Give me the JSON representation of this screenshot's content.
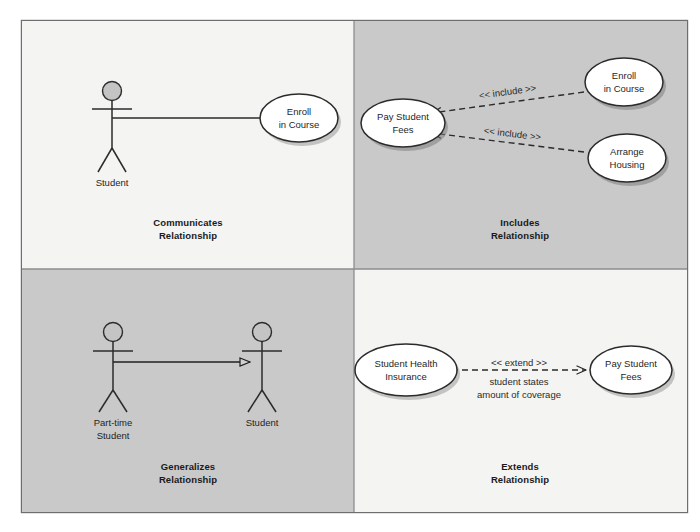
{
  "figure": {
    "background_color": "#ffffff",
    "frame_border_color": "#6e6e6e",
    "panel_light_color": "#f4f4f2",
    "panel_shaded_color": "#c9c9c9",
    "stroke_color": "#2b2b2b",
    "ellipse_fill": "#ffffff",
    "ellipse_stroke": "#2b2b2b",
    "shadow_color": "#8a8a8a",
    "actor_head_fill": "#c4c4c4"
  },
  "panels": [
    {
      "id": "communicates",
      "caption_line1": "Communicates",
      "caption_line2": "Relationship",
      "shade": "light",
      "actors": [
        {
          "name": "student-actor",
          "label_line1": "Student",
          "label_line2": ""
        }
      ],
      "use_cases": [
        {
          "name": "enroll-in-course",
          "label_line1": "Enroll",
          "label_line2": "in Course"
        }
      ],
      "connections": [
        {
          "name": "association-student-enroll",
          "type": "association",
          "from": "Student",
          "to": "Enroll in Course",
          "style": "solid",
          "arrow": "none",
          "label": ""
        }
      ]
    },
    {
      "id": "includes",
      "caption_line1": "Includes",
      "caption_line2": "Relationship",
      "shade": "shaded",
      "actors": [],
      "use_cases": [
        {
          "name": "pay-student-fees",
          "label_line1": "Pay Student",
          "label_line2": "Fees"
        },
        {
          "name": "enroll-in-course",
          "label_line1": "Enroll",
          "label_line2": "in Course"
        },
        {
          "name": "arrange-housing",
          "label_line1": "Arrange",
          "label_line2": "Housing"
        }
      ],
      "connections": [
        {
          "name": "include-enroll-to-fees",
          "type": "include",
          "from": "Enroll in Course",
          "to": "Pay Student Fees",
          "style": "dashed",
          "arrow": "open",
          "label": "<< include >>"
        },
        {
          "name": "include-housing-to-fees",
          "type": "include",
          "from": "Arrange Housing",
          "to": "Pay Student Fees",
          "style": "dashed",
          "arrow": "open",
          "label": "<< include >>"
        }
      ]
    },
    {
      "id": "generalizes",
      "caption_line1": "Generalizes",
      "caption_line2": "Relationship",
      "shade": "shaded",
      "actors": [
        {
          "name": "part-time-student-actor",
          "label_line1": "Part-time",
          "label_line2": "Student"
        },
        {
          "name": "student-actor",
          "label_line1": "Student",
          "label_line2": ""
        }
      ],
      "use_cases": [],
      "connections": [
        {
          "name": "generalization-parttime-to-student",
          "type": "generalization",
          "from": "Part-time Student",
          "to": "Student",
          "style": "solid",
          "arrow": "hollow-triangle",
          "label": ""
        }
      ]
    },
    {
      "id": "extends",
      "caption_line1": "Extends",
      "caption_line2": "Relationship",
      "shade": "light",
      "actors": [],
      "use_cases": [
        {
          "name": "student-health-insurance",
          "label_line1": "Student Health",
          "label_line2": "Insurance"
        },
        {
          "name": "pay-student-fees",
          "label_line1": "Pay Student",
          "label_line2": "Fees"
        }
      ],
      "connections": [
        {
          "name": "extend-insurance-to-fees",
          "type": "extend",
          "from": "Student Health Insurance",
          "to": "Pay Student Fees",
          "style": "dashed",
          "arrow": "open",
          "label": "<< extend >>",
          "condition_line1": "student states",
          "condition_line2": "amount of coverage"
        }
      ]
    }
  ]
}
